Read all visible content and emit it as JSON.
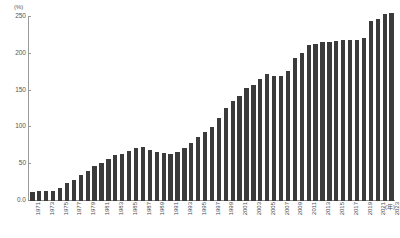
{
  "chart_data": {
    "type": "bar",
    "title": "",
    "subtitle": "",
    "xlabel": "(年)",
    "ylabel": "(%)",
    "ylim": [
      0,
      250
    ],
    "grid": false,
    "legend": "none",
    "bar_color": "#3b3b3b",
    "axis_color": "#9a9a9a",
    "y_unit_label": "(%)",
    "x_unit_label": "(年)",
    "y_ticks": [
      {
        "value": 250,
        "label": "250"
      },
      {
        "value": 200,
        "label": "200"
      },
      {
        "value": 150,
        "label": "150"
      },
      {
        "value": 100,
        "label": "100"
      },
      {
        "value": 50,
        "label": "50"
      },
      {
        "value": 0,
        "label": "0.0"
      }
    ],
    "x_tick_labels": [
      "1971",
      "1973",
      "1975",
      "1977",
      "1979",
      "1981",
      "1983",
      "1985",
      "1987",
      "1989",
      "1991",
      "1993",
      "1995",
      "1997",
      "1999",
      "2001",
      "2003",
      "2005",
      "2007",
      "2009",
      "2011",
      "2013",
      "2015",
      "2017",
      "2019",
      "2021",
      "2023"
    ],
    "categories": [
      "1971",
      "1972",
      "1973",
      "1974",
      "1975",
      "1976",
      "1977",
      "1978",
      "1979",
      "1980",
      "1981",
      "1982",
      "1983",
      "1984",
      "1985",
      "1986",
      "1987",
      "1988",
      "1989",
      "1990",
      "1991",
      "1992",
      "1993",
      "1994",
      "1995",
      "1996",
      "1997",
      "1998",
      "1999",
      "2000",
      "2001",
      "2002",
      "2003",
      "2004",
      "2005",
      "2006",
      "2007",
      "2008",
      "2009",
      "2010",
      "2011",
      "2012",
      "2013",
      "2014",
      "2015",
      "2016",
      "2017",
      "2018",
      "2019",
      "2020",
      "2021",
      "2022",
      "2023"
    ],
    "values": [
      12,
      14,
      13,
      13,
      18,
      24,
      29,
      35,
      41,
      47,
      52,
      57,
      62,
      64,
      68,
      72,
      73,
      69,
      66,
      65,
      64,
      67,
      72,
      79,
      87,
      94,
      100,
      113,
      127,
      136,
      143,
      153,
      158,
      166,
      172,
      170,
      170,
      177,
      194,
      201,
      212,
      214,
      216,
      216,
      218,
      219,
      219,
      219,
      221,
      245,
      247,
      254,
      255
    ]
  }
}
